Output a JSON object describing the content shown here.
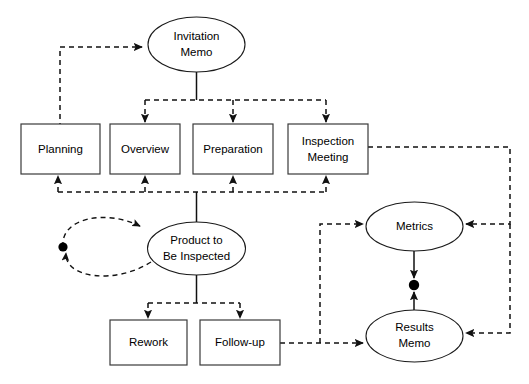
{
  "diagram": {
    "background_color": "#ffffff",
    "line_color": "#111111",
    "node_fill": "#ffffff",
    "node_stroke": "#1a1a1a",
    "nodes": [
      {
        "id": "invitation-memo",
        "shape": "ellipse",
        "label_line1": "Invitation",
        "label_line2": "Memo"
      },
      {
        "id": "planning",
        "shape": "rectangle",
        "label_line1": "Planning",
        "label_line2": ""
      },
      {
        "id": "overview",
        "shape": "rectangle",
        "label_line1": "Overview",
        "label_line2": ""
      },
      {
        "id": "preparation",
        "shape": "rectangle",
        "label_line1": "Preparation",
        "label_line2": ""
      },
      {
        "id": "inspection-meeting",
        "shape": "rectangle",
        "label_line1": "Inspection",
        "label_line2": "Meeting"
      },
      {
        "id": "product-to-be-inspected",
        "shape": "ellipse",
        "label_line1": "Product to",
        "label_line2": "Be Inspected"
      },
      {
        "id": "rework",
        "shape": "rectangle",
        "label_line1": "Rework",
        "label_line2": ""
      },
      {
        "id": "follow-up",
        "shape": "rectangle",
        "label_line1": "Follow-up",
        "label_line2": ""
      },
      {
        "id": "metrics",
        "shape": "ellipse",
        "label_line1": "Metrics",
        "label_line2": ""
      },
      {
        "id": "results-memo",
        "shape": "ellipse",
        "label_line1": "Results",
        "label_line2": "Memo"
      }
    ],
    "edges": [
      {
        "id": "planning-to-invitation-memo",
        "from": "planning",
        "to": "invitation-memo",
        "style": "dashed",
        "arrow": true
      },
      {
        "id": "invitation-memo-to-bus",
        "from": "invitation-memo",
        "to": "distribution-bus",
        "style": "solid",
        "arrow": false
      },
      {
        "id": "bus-to-overview",
        "from": "distribution-bus",
        "to": "overview",
        "style": "dashed",
        "arrow": true
      },
      {
        "id": "bus-to-preparation",
        "from": "distribution-bus",
        "to": "preparation",
        "style": "dashed",
        "arrow": true
      },
      {
        "id": "bus-to-inspection-meeting",
        "from": "distribution-bus",
        "to": "inspection-meeting",
        "style": "dashed",
        "arrow": true
      },
      {
        "id": "product-to-feedback-bus",
        "from": "product-to-be-inspected",
        "to": "feedback-bus",
        "style": "solid",
        "arrow": false
      },
      {
        "id": "feedback-bus-to-planning",
        "from": "feedback-bus",
        "to": "planning",
        "style": "dashed",
        "arrow": true
      },
      {
        "id": "feedback-bus-to-overview",
        "from": "feedback-bus",
        "to": "overview",
        "style": "dashed",
        "arrow": true
      },
      {
        "id": "feedback-bus-to-preparation",
        "from": "feedback-bus",
        "to": "preparation",
        "style": "dashed",
        "arrow": true
      },
      {
        "id": "feedback-bus-to-inspection-meeting",
        "from": "feedback-bus",
        "to": "inspection-meeting",
        "style": "dashed",
        "arrow": true
      },
      {
        "id": "product-self-loop",
        "from": "product-to-be-inspected",
        "to": "product-to-be-inspected",
        "style": "dashed",
        "arrow": true
      },
      {
        "id": "product-to-rework",
        "from": "product-to-be-inspected",
        "to": "rework",
        "style": "dashed",
        "arrow": true
      },
      {
        "id": "product-to-follow-up",
        "from": "product-to-be-inspected",
        "to": "follow-up",
        "style": "dashed",
        "arrow": true
      },
      {
        "id": "follow-up-to-results-memo",
        "from": "follow-up",
        "to": "results-memo",
        "style": "dashed",
        "arrow": true
      },
      {
        "id": "follow-up-to-metrics",
        "from": "follow-up",
        "to": "metrics",
        "style": "dashed",
        "arrow": true
      },
      {
        "id": "inspection-meeting-to-metrics",
        "from": "inspection-meeting",
        "to": "metrics",
        "style": "dashed",
        "arrow": true
      },
      {
        "id": "inspection-meeting-to-results-memo",
        "from": "inspection-meeting",
        "to": "results-memo",
        "style": "dashed",
        "arrow": true
      },
      {
        "id": "metrics-results-memo-link",
        "from": "metrics",
        "to": "results-memo",
        "style": "solid",
        "arrow": true
      }
    ],
    "junctions": [
      {
        "id": "loop-junction-dot",
        "on": "product-self-loop"
      },
      {
        "id": "metrics-results-junction-dot",
        "on": "metrics-results-memo-link"
      }
    ]
  }
}
